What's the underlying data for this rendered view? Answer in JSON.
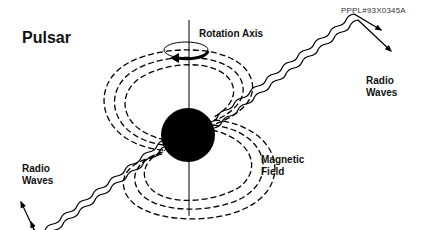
{
  "diagram": {
    "title": "Pulsar",
    "reference_id": "PPPL#93X0345A",
    "labels": {
      "rotation_axis": "Rotation Axis",
      "radio_waves_right": [
        "Radio",
        "Waves"
      ],
      "radio_waves_left": [
        "Radio",
        "Waves"
      ],
      "magnetic_field": [
        "Magnetic",
        "Field"
      ]
    },
    "elements": {
      "star": {
        "shape": "filled-circle",
        "color": "#000000"
      },
      "axis": {
        "shape": "vertical-line",
        "color": "#000000"
      },
      "rotation_arrow": {
        "shape": "curved-arrow-around-axis"
      },
      "field_lines": {
        "style": "dashed",
        "count_per_lobe": 3
      },
      "radio_beams": {
        "style": "wavy-arrow",
        "count_per_side": 2
      }
    },
    "colors": {
      "ink": "#000000",
      "background": "#ffffff"
    }
  }
}
